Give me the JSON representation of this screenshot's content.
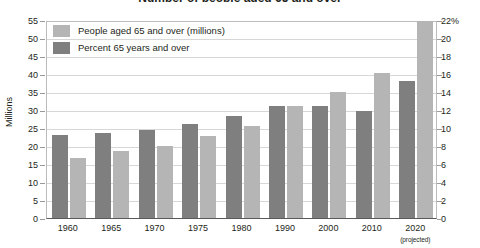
{
  "chart_data": {
    "type": "bar",
    "title": "Number of people aged 65 and over",
    "categories": [
      "1960",
      "1965",
      "1970",
      "1975",
      "1980",
      "1990",
      "2000",
      "2010",
      "2020"
    ],
    "category_notes": [
      "",
      "",
      "",
      "",
      "",
      "",
      "",
      "",
      "(projected)"
    ],
    "series": [
      {
        "name": "Percent 65 years and over",
        "axis": "right",
        "unit": "%",
        "color": "#7f7f7f",
        "values": [
          9.2,
          9.5,
          9.8,
          10.5,
          11.3,
          12.5,
          12.4,
          11.9,
          15.2
        ]
      },
      {
        "name": "People aged 65 and over (millions)",
        "axis": "left",
        "unit": "millions",
        "color": "#b5b5b5",
        "values": [
          16.6,
          18.5,
          20.1,
          22.7,
          25.5,
          31.2,
          35.0,
          40.3,
          54.6
        ]
      }
    ],
    "left_axis": {
      "label": "Millions",
      "ticks": [
        0,
        5,
        10,
        15,
        20,
        25,
        30,
        35,
        40,
        45,
        50,
        55
      ],
      "ylim": [
        0,
        55
      ]
    },
    "right_axis": {
      "label": "%",
      "ticks": [
        "0",
        "2",
        "4",
        "6",
        "8",
        "10",
        "12",
        "14",
        "16",
        "18",
        "20",
        "22%"
      ],
      "ylim": [
        0,
        22
      ]
    },
    "grid": true,
    "legend_position": "top-left"
  },
  "legend": {
    "items": [
      {
        "label": "People aged 65 and over (millions)",
        "swatch": "mil"
      },
      {
        "label": "Percent 65 years and over",
        "swatch": "pct"
      }
    ]
  }
}
